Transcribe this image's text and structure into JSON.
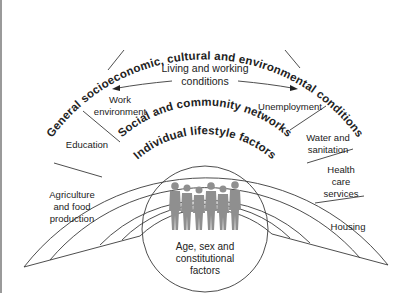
{
  "diagram": {
    "layers": {
      "outer": "General socioeconomic, cultural and environmental conditions",
      "living_working": "Living and working conditions",
      "social": "Social and community networks",
      "lifestyle": "Individual lifestyle factors",
      "core": [
        "Age, sex and",
        "constitutional",
        "factors"
      ]
    },
    "sectors_left": [
      {
        "name": "work-environment",
        "lines": [
          "Work",
          "environment"
        ]
      },
      {
        "name": "education",
        "lines": [
          "Education"
        ]
      },
      {
        "name": "agriculture",
        "lines": [
          "Agriculture",
          "and food",
          "production"
        ]
      }
    ],
    "sectors_right": [
      {
        "name": "unemployment",
        "lines": [
          "Unemployment"
        ]
      },
      {
        "name": "water",
        "lines": [
          "Water and",
          "sanitation"
        ]
      },
      {
        "name": "health-care",
        "lines": [
          "Health",
          "care",
          "services"
        ]
      },
      {
        "name": "housing",
        "lines": [
          "Housing"
        ]
      }
    ],
    "colors": {
      "stroke": "#3a3a3a",
      "people": "#8f8f8f",
      "text": "#222222"
    }
  }
}
